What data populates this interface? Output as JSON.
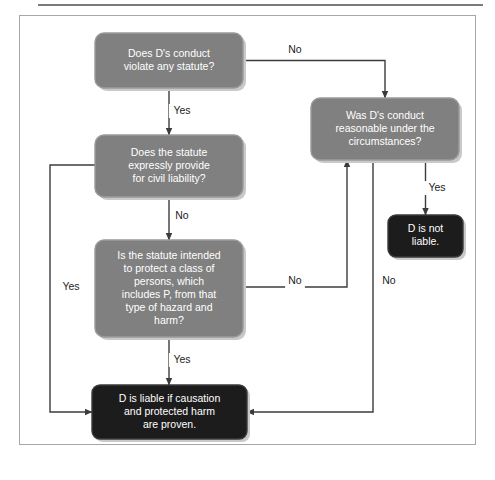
{
  "page": {
    "title_fragment": "",
    "background_color": "#ffffff",
    "frame_border_color": "#a7a7a7",
    "rule_color": "#7b7b7b"
  },
  "chart_data": {
    "type": "diagram",
    "title": "",
    "diagram_kind": "flowchart",
    "colors": {
      "decision_fill": "#808080",
      "terminal_fill": "#1c1c1c",
      "node_text": "#ffffff",
      "edge_label_text": "#1c1c1c",
      "connector": "#3c3c3c",
      "shadow": "#c9c9c9"
    },
    "nodes": [
      {
        "id": "n1",
        "kind": "decision",
        "lines": [
          "Does D's conduct",
          "violate any statute?"
        ],
        "x": 95,
        "y": 33,
        "w": 148,
        "h": 55
      },
      {
        "id": "n2",
        "kind": "decision",
        "lines": [
          "Does the statute",
          "expressly provide",
          "for civil liability?"
        ],
        "x": 95,
        "y": 135,
        "w": 148,
        "h": 62
      },
      {
        "id": "n3",
        "kind": "decision",
        "lines": [
          "Is the statute intended",
          "to protect a class of",
          "persons, which",
          "includes P, from that",
          "type of hazard and",
          "harm?"
        ],
        "x": 95,
        "y": 240,
        "w": 148,
        "h": 97
      },
      {
        "id": "n4",
        "kind": "decision",
        "lines": [
          "Was D's conduct",
          "reasonable under the",
          "circumstances?"
        ],
        "x": 311,
        "y": 98,
        "w": 148,
        "h": 62
      },
      {
        "id": "n5",
        "kind": "terminal",
        "lines": [
          "D is not",
          "liable."
        ],
        "x": 388,
        "y": 215,
        "w": 75,
        "h": 42
      },
      {
        "id": "n6",
        "kind": "terminal",
        "lines": [
          "D is liable if causation",
          "and protected harm",
          "are proven."
        ],
        "x": 92,
        "y": 385,
        "w": 155,
        "h": 54
      }
    ],
    "edges": [
      {
        "id": "e1",
        "from": "n1",
        "to": "n2",
        "label": "Yes",
        "label_x": 182,
        "label_y": 111
      },
      {
        "id": "e2",
        "from": "n1",
        "to": "n4",
        "label": "No",
        "label_x": 295,
        "label_y": 50
      },
      {
        "id": "e3",
        "from": "n2",
        "to": "n3",
        "label": "No",
        "label_x": 182,
        "label_y": 216
      },
      {
        "id": "e4",
        "from": "n2",
        "to": "n6",
        "label": "Yes",
        "label_x": 71,
        "label_y": 287
      },
      {
        "id": "e5",
        "from": "n3",
        "to": "n6",
        "label": "Yes",
        "label_x": 182,
        "label_y": 360
      },
      {
        "id": "e6",
        "from": "n3",
        "to": "n4",
        "label": "No",
        "label_x": 295,
        "label_y": 281
      },
      {
        "id": "e7",
        "from": "n4",
        "to": "n5",
        "label": "Yes",
        "label_x": 437,
        "label_y": 188
      },
      {
        "id": "e8",
        "from": "n4",
        "to": "n6",
        "label": "No",
        "label_x": 389,
        "label_y": 281
      }
    ]
  }
}
